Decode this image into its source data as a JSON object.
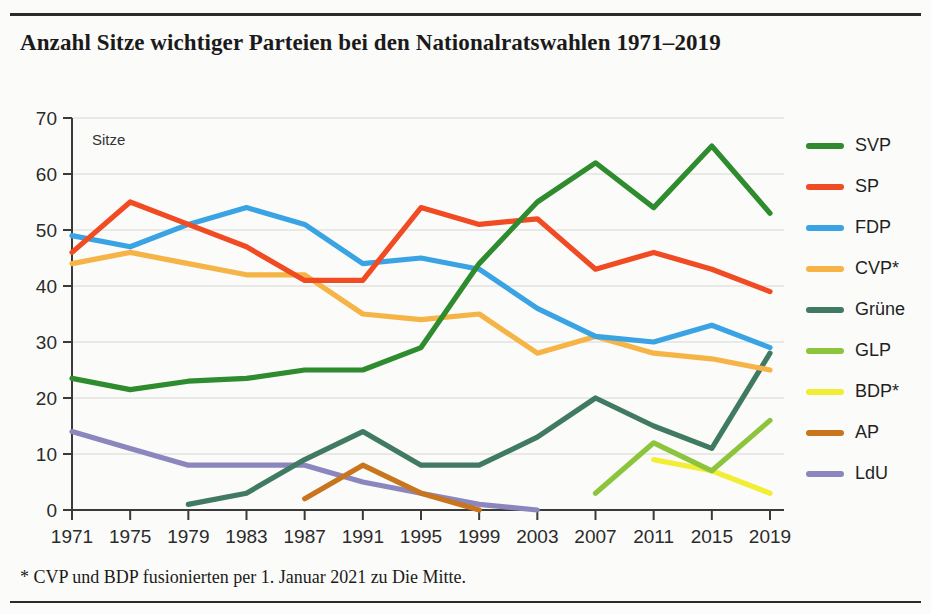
{
  "chart_data": {
    "type": "line",
    "title": "Anzahl Sitze wichtiger Parteien bei den Nationalratswahlen 1971–2019",
    "footnote": "* CVP und BDP fusionierten per 1. Januar 2021 zu Die Mitte.",
    "xlabel": "",
    "ylabel": "Sitze",
    "categories": [
      1971,
      1975,
      1979,
      1983,
      1987,
      1991,
      1995,
      1999,
      2003,
      2007,
      2011,
      2015,
      2019
    ],
    "xtick_labels": [
      "1971",
      "1975",
      "1979",
      "1983",
      "1987",
      "1991",
      "1995",
      "1999",
      "2003",
      "2007",
      "2011",
      "2015",
      "2019"
    ],
    "ytick_labels": [
      "0",
      "10",
      "20",
      "30",
      "40",
      "50",
      "60",
      "70"
    ],
    "ylim": [
      0,
      70
    ],
    "ytick_step": 10,
    "grid": true,
    "legend_position": "right",
    "series": [
      {
        "name": "SVP",
        "color": "#2e8b2e",
        "values": [
          23.5,
          21.5,
          23,
          23.5,
          25,
          25,
          29,
          44,
          55,
          62,
          54,
          65,
          53
        ]
      },
      {
        "name": "SP",
        "color": "#f04b23",
        "values": [
          46,
          55,
          51,
          47,
          41,
          41,
          54,
          51,
          52,
          43,
          46,
          43,
          39
        ]
      },
      {
        "name": "FDP",
        "color": "#3aa3e3",
        "values": [
          49,
          47,
          51,
          54,
          51,
          44,
          45,
          43,
          36,
          31,
          30,
          33,
          29
        ]
      },
      {
        "name": "CVP*",
        "color": "#f5b445",
        "values": [
          44,
          46,
          44,
          42,
          42,
          35,
          34,
          35,
          28,
          31,
          28,
          27,
          25
        ]
      },
      {
        "name": "Grüne",
        "color": "#417a63",
        "values": [
          null,
          null,
          1,
          3,
          9,
          14,
          8,
          8,
          13,
          20,
          15,
          11,
          28
        ]
      },
      {
        "name": "GLP",
        "color": "#8cc43c",
        "values": [
          null,
          null,
          null,
          null,
          null,
          null,
          null,
          null,
          null,
          3,
          12,
          7,
          16
        ]
      },
      {
        "name": "BDP*",
        "color": "#f2ed35",
        "values": [
          null,
          null,
          null,
          null,
          null,
          null,
          null,
          null,
          null,
          null,
          9,
          7,
          3
        ]
      },
      {
        "name": "AP",
        "color": "#c8751e",
        "values": [
          null,
          null,
          null,
          null,
          2,
          8,
          3,
          0,
          null,
          null,
          null,
          null,
          null
        ]
      },
      {
        "name": "LdU",
        "color": "#8b86bd",
        "values": [
          14,
          11,
          8,
          8,
          8,
          5,
          3,
          1,
          0,
          null,
          null,
          null,
          null
        ]
      }
    ]
  },
  "legend": {
    "items": [
      {
        "label": "SVP"
      },
      {
        "label": "SP"
      },
      {
        "label": "FDP"
      },
      {
        "label": "CVP*"
      },
      {
        "label": "Grüne"
      },
      {
        "label": "GLP"
      },
      {
        "label": "BDP*"
      },
      {
        "label": "AP"
      },
      {
        "label": "LdU"
      }
    ]
  }
}
